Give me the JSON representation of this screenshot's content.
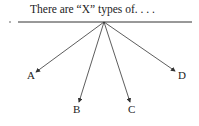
{
  "diagram": {
    "title": "There are “X” types of. . . .",
    "branches": [
      {
        "label": "A"
      },
      {
        "label": "B"
      },
      {
        "label": "C"
      },
      {
        "label": "D"
      }
    ],
    "colors": {
      "ink": "#333333"
    }
  }
}
